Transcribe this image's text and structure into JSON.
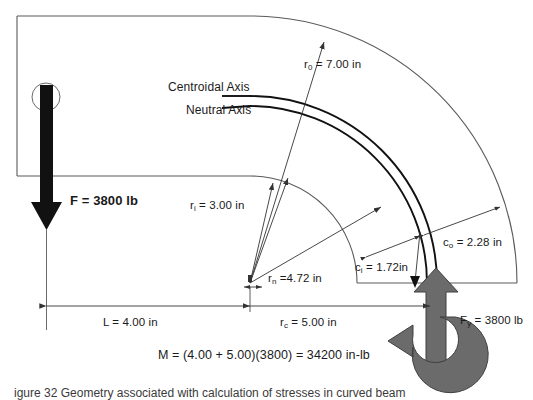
{
  "figure": {
    "caption": "igure 32   Geometry associated with calculation of stresses in curved beam",
    "colors": {
      "outline": "#5a5a5a",
      "axis_line": "#111111",
      "dimension": "#333333",
      "force_arrow": "#111111",
      "reaction_arrow": "#6b6b6b",
      "moment_arrow": "#6b6b6b",
      "text": "#1a1a1a"
    }
  },
  "labels": {
    "centroidal_axis": "Centroidal Axis",
    "neutral_axis": "Neutral Axis",
    "r_outer": "r",
    "r_outer_sub": "0",
    "r_outer_val": " = 7.00 in",
    "r_inner": "r",
    "r_inner_sub": "i",
    "r_inner_val": " = 3.00 in",
    "r_neutral": "r",
    "r_neutral_sub": "n",
    "r_neutral_val": " =4.72 in",
    "r_centroid": "r",
    "r_centroid_sub": "c",
    "r_centroid_val": " = 5.00 in",
    "c_inner": "c",
    "c_inner_sub": "i",
    "c_inner_val": " = 1.72in",
    "c_outer": "c",
    "c_outer_sub": "o",
    "c_outer_val": " = 2.28 in",
    "length": "L = 4.00 in",
    "force": "F",
    "force_val": " = 3800 lb",
    "reaction": "F",
    "reaction_sub": "y",
    "reaction_val": " = 3800 lb",
    "moment": "M = (4.00 + 5.00)(3800) = 34200 in-lb"
  },
  "values": {
    "r_outer_in": 7.0,
    "r_inner_in": 3.0,
    "r_neutral_in": 4.72,
    "r_centroid_in": 5.0,
    "c_inner_in": 1.72,
    "c_outer_in": 2.28,
    "length_in": 4.0,
    "force_lb": 3800,
    "reaction_lb": 3800,
    "moment_in_lb": 34200
  }
}
